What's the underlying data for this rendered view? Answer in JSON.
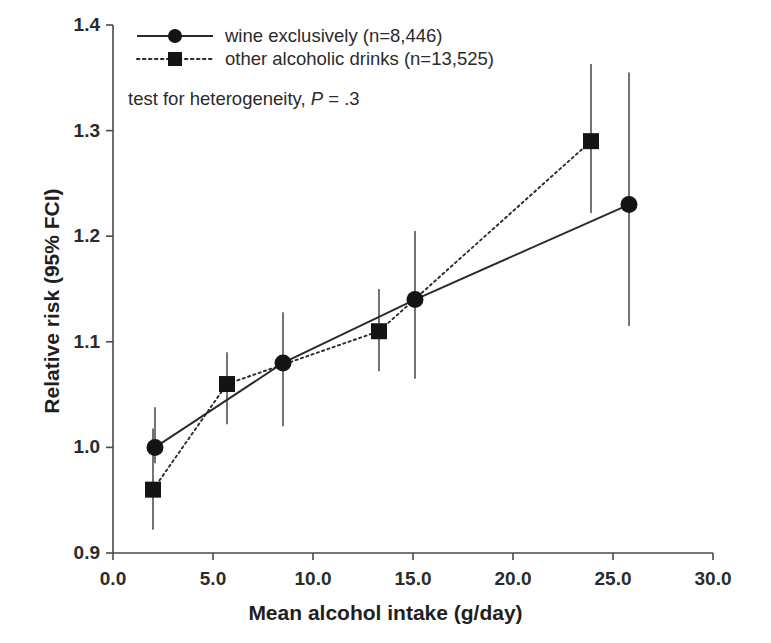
{
  "chart_data": {
    "type": "line",
    "title": "",
    "xlabel": "Mean alcohol intake (g/day)",
    "ylabel": "Relative risk (95% FCI)",
    "xlim": [
      0.0,
      30.0
    ],
    "ylim": [
      0.9,
      1.4
    ],
    "xticks": [
      "0.0",
      "5.0",
      "10.0",
      "15.0",
      "20.0",
      "25.0",
      "30.0"
    ],
    "xtick_values": [
      0.0,
      5.0,
      10.0,
      15.0,
      20.0,
      25.0,
      30.0
    ],
    "yticks": [
      "0.9",
      "1.0",
      "1.1",
      "1.2",
      "1.3",
      "1.4"
    ],
    "ytick_values": [
      0.9,
      1.0,
      1.1,
      1.2,
      1.3,
      1.4
    ],
    "grid": false,
    "legend_position": "top-left",
    "annotation": "test for heterogeneity, P = .3",
    "annotation_label": "test for heterogeneity,",
    "annotation_stat": "P",
    "annotation_value": "= .3",
    "series": [
      {
        "name": "wine exclusively (n=8,446)",
        "marker": "circle",
        "linestyle": "solid",
        "color": "#141414",
        "x": [
          2.1,
          8.5,
          15.1,
          25.8
        ],
        "values": [
          1.0,
          1.08,
          1.14,
          1.23
        ],
        "ci_low": [
          0.985,
          1.02,
          1.065,
          1.115
        ],
        "ci_high": [
          1.038,
          1.128,
          1.205,
          1.355
        ]
      },
      {
        "name": "other alcoholic drinks (n=13,525)",
        "marker": "square",
        "linestyle": "dotted",
        "color": "#141414",
        "x": [
          2.0,
          5.7,
          13.3,
          23.9
        ],
        "values": [
          0.96,
          1.06,
          1.11,
          1.29
        ],
        "ci_low": [
          0.922,
          1.022,
          1.072,
          1.222
        ],
        "ci_high": [
          1.018,
          1.09,
          1.15,
          1.363
        ]
      }
    ]
  },
  "legend": {
    "items": [
      {
        "label": "wine exclusively (n=8,446)",
        "marker": "circle",
        "linestyle": "solid"
      },
      {
        "label": "other alcoholic drinks (n=13,525)",
        "marker": "square",
        "linestyle": "dotted"
      }
    ]
  },
  "colors": {
    "axis": "#4a4a4a",
    "marker": "#141414",
    "errorbar": "#6e6e6e",
    "background": "#ffffff"
  }
}
